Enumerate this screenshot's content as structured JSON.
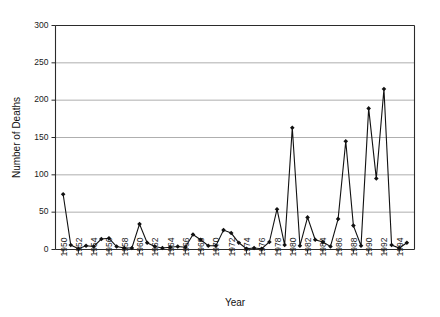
{
  "chart_data": {
    "type": "line",
    "title": "",
    "xlabel": "Year",
    "ylabel": "Number of Deaths",
    "xlim": [
      1949,
      1996
    ],
    "ylim": [
      0,
      300
    ],
    "ytick_step": 50,
    "yticks": [
      0,
      50,
      100,
      150,
      200,
      250,
      300
    ],
    "ytick_labels": [
      "0",
      "50",
      "100",
      "150",
      "200",
      "250",
      "300"
    ],
    "xtick_step": 2,
    "xticks": [
      1950,
      1952,
      1954,
      1956,
      1958,
      1960,
      1962,
      1964,
      1966,
      1968,
      1970,
      1972,
      1974,
      1976,
      1978,
      1980,
      1982,
      1984,
      1986,
      1988,
      1990,
      1992,
      1994
    ],
    "xtick_labels": [
      "1950",
      "1952",
      "1954",
      "1956",
      "1958",
      "1960",
      "1962",
      "1964",
      "1966",
      "1968",
      "1970",
      "1972",
      "1974",
      "1976",
      "1978",
      "1980",
      "1982",
      "1984",
      "1986",
      "1988",
      "1990",
      "1992",
      "1994"
    ],
    "grid": "horizontal",
    "legend": "none",
    "marker": "filled-diamond",
    "line_color": "#111111",
    "grid_color": "#8c8c8c",
    "x": [
      1950,
      1951,
      1952,
      1953,
      1954,
      1955,
      1956,
      1957,
      1958,
      1959,
      1960,
      1961,
      1962,
      1963,
      1964,
      1965,
      1966,
      1967,
      1968,
      1969,
      1970,
      1971,
      1972,
      1973,
      1974,
      1975,
      1976,
      1977,
      1978,
      1979,
      1980,
      1981,
      1982,
      1983,
      1984,
      1985,
      1986,
      1987,
      1988,
      1989,
      1990,
      1991,
      1992,
      1993,
      1994,
      1995
    ],
    "values": [
      74,
      6,
      1,
      5,
      4,
      14,
      15,
      4,
      2,
      2,
      34,
      9,
      4,
      2,
      3,
      4,
      3,
      20,
      13,
      5,
      5,
      26,
      22,
      9,
      1,
      2,
      1,
      10,
      54,
      6,
      163,
      5,
      43,
      13,
      10,
      4,
      41,
      145,
      32,
      5,
      189,
      95,
      215,
      6,
      2,
      9
    ],
    "series": [
      {
        "name": "Number of Deaths",
        "values": [
          74,
          6,
          1,
          5,
          4,
          14,
          15,
          4,
          2,
          2,
          34,
          9,
          4,
          2,
          3,
          4,
          3,
          20,
          13,
          5,
          5,
          26,
          22,
          9,
          1,
          2,
          1,
          10,
          54,
          6,
          163,
          5,
          43,
          13,
          10,
          4,
          41,
          145,
          32,
          5,
          189,
          95,
          215,
          6,
          2,
          9
        ]
      }
    ]
  }
}
